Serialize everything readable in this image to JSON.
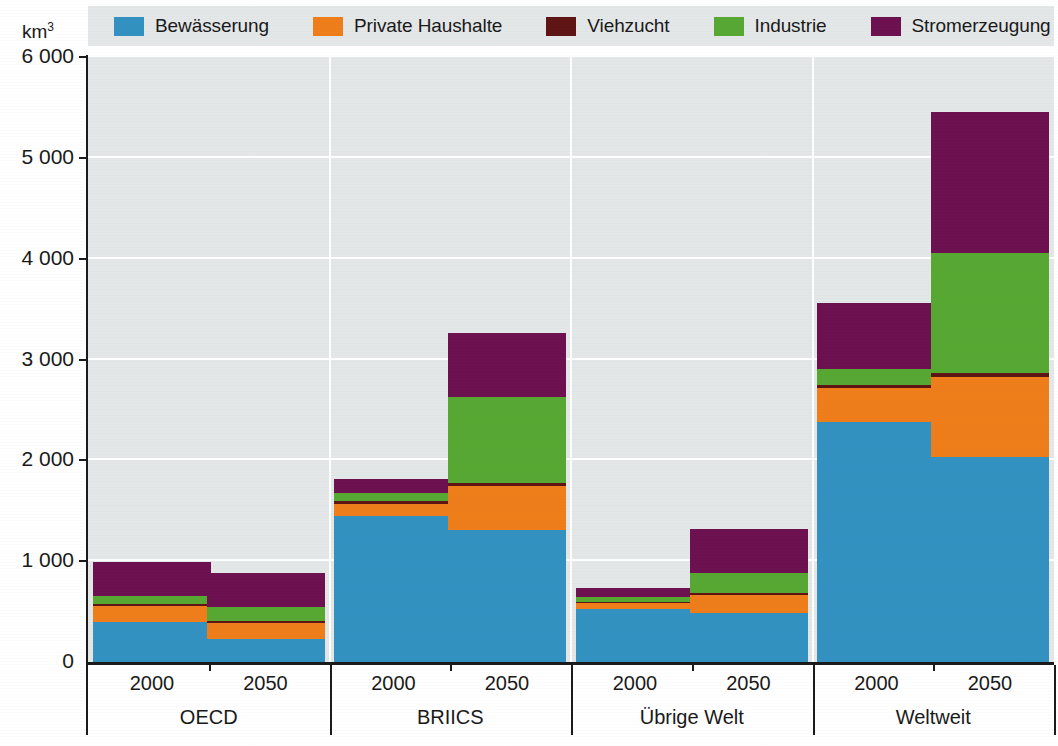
{
  "unit": {
    "text": "km",
    "exponent": "3"
  },
  "legend": {
    "items": [
      {
        "label": "Bewässerung",
        "color": "#3291c1",
        "key": "irrigation"
      },
      {
        "label": "Private Haushalte",
        "color": "#ef7d1a",
        "key": "households"
      },
      {
        "label": "Viehzucht",
        "color": "#5d1413",
        "key": "livestock"
      },
      {
        "label": "Industrie",
        "color": "#57a832",
        "key": "industry"
      },
      {
        "label": "Stromerzeugung",
        "color": "#6d1050",
        "key": "electricity"
      }
    ],
    "background": "#e4e7e8"
  },
  "axes": {
    "y_ticks": [
      "0",
      "1 000",
      "2 000",
      "3 000",
      "4 000",
      "5 000",
      "6 000"
    ],
    "y_min": 0,
    "y_max": 6000,
    "y_step": 1000,
    "axis_color": "#1a1a1a",
    "plot_background": "#e4e7e8",
    "gridline_color": "#ffffff"
  },
  "chart_data": {
    "type": "bar",
    "stacked": true,
    "title": "",
    "xlabel": "",
    "ylabel": "km3",
    "ylim": [
      0,
      6000
    ],
    "grid": true,
    "legend_position": "top",
    "categories": [
      "OECD 2000",
      "OECD 2050",
      "BRIICS 2000",
      "BRIICS 2050",
      "Übrige Welt 2000",
      "Übrige Welt 2050",
      "Weltweit 2000",
      "Weltweit 2050"
    ],
    "groups": [
      {
        "name": "OECD",
        "years": [
          "2000",
          "2050"
        ]
      },
      {
        "name": "BRIICS",
        "years": [
          "2000",
          "2050"
        ]
      },
      {
        "name": "Übrige Welt",
        "years": [
          "2000",
          "2050"
        ]
      },
      {
        "name": "Weltweit",
        "years": [
          "2000",
          "2050"
        ]
      }
    ],
    "series": [
      {
        "name": "Bewässerung",
        "color": "#3291c1",
        "values": [
          400,
          225,
          1450,
          1310,
          530,
          490,
          2380,
          2030
        ]
      },
      {
        "name": "Private Haushalte",
        "color": "#ef7d1a",
        "values": [
          155,
          165,
          120,
          440,
          55,
          175,
          340,
          795
        ]
      },
      {
        "name": "Viehzucht",
        "color": "#5d1413",
        "values": [
          20,
          18,
          30,
          25,
          15,
          20,
          25,
          45
        ]
      },
      {
        "name": "Industrie",
        "color": "#57a832",
        "values": [
          80,
          135,
          75,
          855,
          40,
          195,
          160,
          1190
        ]
      },
      {
        "name": "Stromerzeugung",
        "color": "#6d1050",
        "values": [
          340,
          335,
          145,
          630,
          90,
          440,
          655,
          1390
        ]
      }
    ],
    "totals": [
      995,
      878,
      1820,
      3260,
      730,
      1320,
      3560,
      5450
    ]
  }
}
